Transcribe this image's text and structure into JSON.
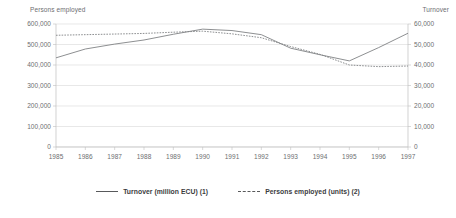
{
  "chart_data": {
    "type": "line",
    "title": "",
    "x": [
      1985,
      1986,
      1987,
      1988,
      1989,
      1990,
      1991,
      1992,
      1993,
      1994,
      1995,
      1996,
      1997
    ],
    "categories": [
      "1985",
      "1986",
      "1987",
      "1988",
      "1989",
      "1990",
      "1991",
      "1992",
      "1993",
      "1994",
      "1995",
      "1996",
      "1997"
    ],
    "series": [
      {
        "name": "Turnover (million ECU) (1)",
        "axis": "right",
        "style": "solid",
        "values": [
          43500,
          47800,
          50200,
          52200,
          55000,
          57500,
          56800,
          54800,
          48200,
          45000,
          42000,
          48500,
          55500
        ]
      },
      {
        "name": "Persons employed (units) (2)",
        "axis": "left",
        "style": "dashed",
        "values": [
          545000,
          548000,
          551000,
          554000,
          560000,
          565000,
          552000,
          533000,
          490000,
          452000,
          400000,
          392000,
          395000
        ]
      }
    ],
    "xlabel": "",
    "ylabel": "Persons employed",
    "y2label": "Turnover",
    "ylim": [
      0,
      600000
    ],
    "y2lim": [
      0,
      60000
    ],
    "yticks": [
      "0",
      "100,000",
      "200,000",
      "300,000",
      "400,000",
      "500,000",
      "600,000"
    ],
    "ytick_values": [
      0,
      100000,
      200000,
      300000,
      400000,
      500000,
      600000
    ],
    "y2ticks": [
      "0",
      "10,000",
      "20,000",
      "30,000",
      "40,000",
      "50,000",
      "60,000"
    ],
    "y2tick_values": [
      0,
      10000,
      20000,
      30000,
      40000,
      50000,
      60000
    ],
    "grid": true,
    "legend_position": "bottom",
    "line_color": "#808285"
  },
  "axes": {
    "left_title": "Persons employed",
    "right_title": "Turnover"
  },
  "legend": {
    "items": [
      {
        "label": "Turnover (million ECU) (1)",
        "style": "solid"
      },
      {
        "label": "Persons employed (units) (2)",
        "style": "dashed"
      }
    ]
  }
}
